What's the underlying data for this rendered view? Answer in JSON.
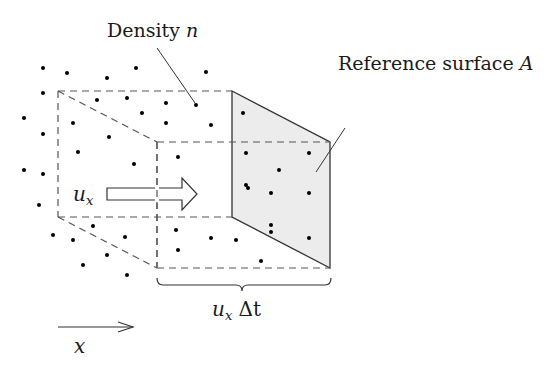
{
  "labels": {
    "density": {
      "text": "Density ",
      "var": "n"
    },
    "surface": {
      "text": "Reference surface ",
      "var": "A"
    },
    "velocity": {
      "var": "u",
      "sub": "x"
    },
    "displacement": {
      "var": "u",
      "sub": "x",
      "rest": " Δt"
    },
    "axis": {
      "var": "x"
    }
  },
  "colors": {
    "line": "#333333",
    "dash": "#555555",
    "surface_fill": "#ececec",
    "dot": "#000000",
    "text": "#1a1a1a"
  },
  "geometry": {
    "back_box": {
      "x1": 58,
      "y1": 91,
      "x2": 232,
      "y2": 217
    },
    "front_box": {
      "x1": 157,
      "y1": 142,
      "x2": 330,
      "y2": 268
    },
    "surface_polygon": "232,91 330,142 330,268 232,217"
  },
  "dots": [
    [
      43,
      68
    ],
    [
      67,
      73
    ],
    [
      107,
      78
    ],
    [
      136,
      68
    ],
    [
      206,
      72
    ],
    [
      43,
      93
    ],
    [
      97,
      100
    ],
    [
      127,
      98
    ],
    [
      166,
      103
    ],
    [
      196,
      105
    ],
    [
      24,
      118
    ],
    [
      73,
      123
    ],
    [
      142,
      113
    ],
    [
      166,
      123
    ],
    [
      211,
      125
    ],
    [
      243,
      113
    ],
    [
      43,
      134
    ],
    [
      109,
      137
    ],
    [
      78,
      152
    ],
    [
      134,
      164
    ],
    [
      178,
      157
    ],
    [
      246,
      153
    ],
    [
      24,
      170
    ],
    [
      43,
      174
    ],
    [
      39,
      205
    ],
    [
      246,
      185
    ],
    [
      279,
      170
    ],
    [
      309,
      153
    ],
    [
      248,
      188
    ],
    [
      271,
      193
    ],
    [
      309,
      193
    ],
    [
      93,
      226
    ],
    [
      53,
      235
    ],
    [
      73,
      240
    ],
    [
      125,
      237
    ],
    [
      107,
      255
    ],
    [
      83,
      265
    ],
    [
      127,
      275
    ],
    [
      176,
      230
    ],
    [
      178,
      250
    ],
    [
      211,
      238
    ],
    [
      236,
      240
    ],
    [
      271,
      232
    ],
    [
      309,
      238
    ],
    [
      261,
      261
    ],
    [
      271,
      225
    ]
  ]
}
